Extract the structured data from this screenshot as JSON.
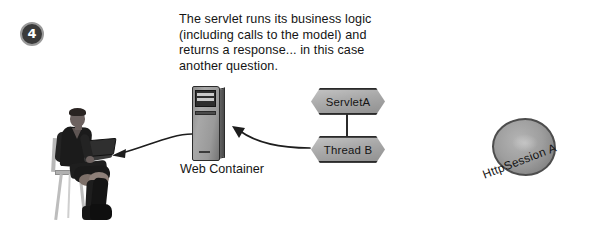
{
  "diagram": {
    "step_number": "4",
    "caption": "The servlet runs its business logic\n(including calls to the model) and\nreturns a response... in this case\nanother question.",
    "container": {
      "label": "Web Container"
    },
    "nodes": [
      {
        "id": "servlet",
        "label": "ServletA",
        "shape": "hexagon"
      },
      {
        "id": "thread",
        "label": "Thread B",
        "shape": "hexagon"
      }
    ],
    "session": {
      "label": "HttpSession A",
      "shape": "blob"
    },
    "actor": {
      "label": "seated user with laptop"
    },
    "arrows": [
      {
        "id": "response",
        "from": "Web Container",
        "to": "user",
        "direction": "left"
      },
      {
        "id": "request",
        "from": "Thread B",
        "to": "Web Container",
        "direction": "up-left"
      }
    ],
    "colors": {
      "ink": "#1c1c1c",
      "node_fill": "#a9a9a9",
      "node_stroke": "#2a2a2a",
      "badge_fill": "#3a3a3a",
      "background": "#ffffff"
    }
  }
}
